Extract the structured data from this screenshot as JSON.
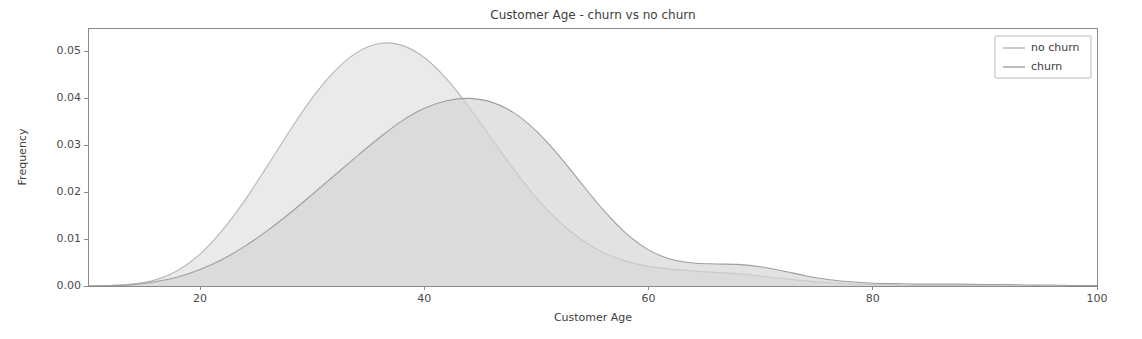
{
  "chart_data": {
    "type": "area",
    "title": "Customer Age - churn vs no churn",
    "xlabel": "Customer Age",
    "ylabel": "Frequency",
    "xlim": [
      10,
      100
    ],
    "ylim": [
      0.0,
      0.055
    ],
    "xticks": [
      20,
      40,
      60,
      80,
      100
    ],
    "xticklabels": [
      "20",
      "40",
      "60",
      "80",
      "100"
    ],
    "yticks": [
      0.0,
      0.01,
      0.02,
      0.03,
      0.04,
      0.05
    ],
    "yticklabels": [
      "0.00",
      "0.01",
      "0.02",
      "0.03",
      "0.04",
      "0.05"
    ],
    "grid": false,
    "legend_position": "upper right",
    "legend_entries": [
      "no churn",
      "churn"
    ],
    "colors": {
      "no_churn_line": "#b6b6b6",
      "no_churn_fill": "#e3e3e3",
      "churn_line": "#9e9e9e",
      "churn_fill": "#d2d2d2",
      "axis": "#8a8a8a",
      "text": "#3d3d3d",
      "background": "#ffffff"
    },
    "x": [
      10,
      12,
      14,
      16,
      18,
      20,
      22,
      24,
      26,
      28,
      30,
      32,
      34,
      36,
      38,
      40,
      42,
      44,
      46,
      48,
      50,
      52,
      54,
      56,
      58,
      60,
      62,
      64,
      66,
      68,
      70,
      72,
      74,
      76,
      78,
      80,
      82,
      84,
      86,
      88,
      90,
      92,
      94,
      96,
      98,
      100
    ],
    "series": [
      {
        "name": "no churn",
        "peak_x": 35,
        "peak_y": 0.0518,
        "values": [
          0.0,
          0.0001,
          0.0004,
          0.0013,
          0.0033,
          0.0068,
          0.0119,
          0.0183,
          0.0256,
          0.0331,
          0.0401,
          0.0458,
          0.0498,
          0.0517,
          0.0513,
          0.0487,
          0.0441,
          0.0381,
          0.0314,
          0.0248,
          0.0188,
          0.0138,
          0.0099,
          0.0071,
          0.0053,
          0.0042,
          0.0036,
          0.0032,
          0.0029,
          0.0026,
          0.0021,
          0.0016,
          0.0011,
          0.0007,
          0.0004,
          0.0003,
          0.0002,
          0.0001,
          0.0001,
          0.0001,
          0.0,
          0.0,
          0.0,
          0.0,
          0.0,
          0.0
        ]
      },
      {
        "name": "churn",
        "peak_x": 45,
        "peak_y": 0.04,
        "values": [
          0.0,
          0.0001,
          0.0003,
          0.0009,
          0.0019,
          0.0035,
          0.0057,
          0.0085,
          0.0118,
          0.0155,
          0.0195,
          0.0236,
          0.0277,
          0.0316,
          0.0352,
          0.0379,
          0.0395,
          0.04,
          0.0392,
          0.0369,
          0.033,
          0.0278,
          0.0219,
          0.0161,
          0.0112,
          0.0077,
          0.0057,
          0.0049,
          0.0047,
          0.0046,
          0.0041,
          0.0032,
          0.0022,
          0.0014,
          0.0009,
          0.0006,
          0.0005,
          0.0004,
          0.0004,
          0.0004,
          0.0003,
          0.0003,
          0.0002,
          0.0002,
          0.0001,
          0.0001
        ]
      }
    ]
  },
  "figure": {
    "plot_area": {
      "left": 88,
      "top": 28,
      "right": 1097,
      "bottom": 286
    }
  }
}
